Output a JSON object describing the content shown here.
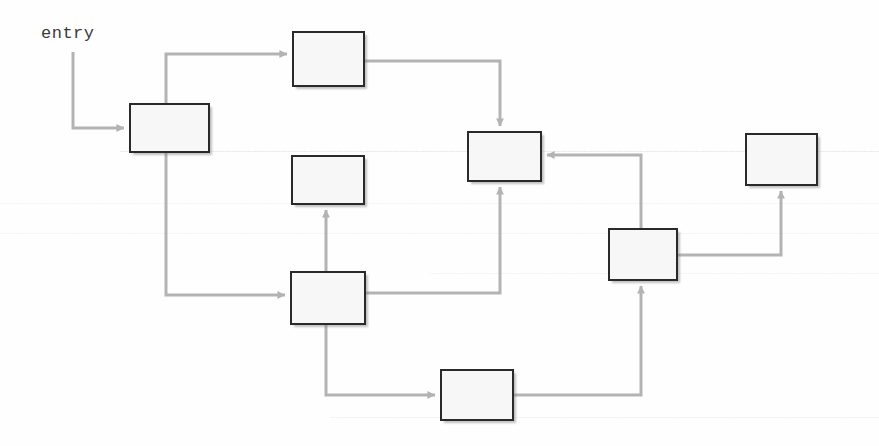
{
  "diagram": {
    "type": "control-flow-graph",
    "title": "",
    "entry_label": "entry",
    "canvas": {
      "width": 879,
      "height": 446
    },
    "style": {
      "background_color": "#fefefe",
      "node_fill": "#f7f7f7",
      "node_border_color": "#2a2a2a",
      "edge_color": "#b3b3b3",
      "label_color": "#3a3a3a"
    },
    "nodes": [
      {
        "id": "n1",
        "label": "",
        "x": 129,
        "y": 103,
        "w": 81,
        "h": 50
      },
      {
        "id": "n2",
        "label": "",
        "x": 292,
        "y": 31,
        "w": 73,
        "h": 56
      },
      {
        "id": "n3",
        "label": "",
        "x": 291,
        "y": 155,
        "w": 74,
        "h": 50
      },
      {
        "id": "n4",
        "label": "",
        "x": 467,
        "y": 131,
        "w": 75,
        "h": 51
      },
      {
        "id": "n5",
        "label": "",
        "x": 290,
        "y": 271,
        "w": 76,
        "h": 54
      },
      {
        "id": "n6",
        "label": "",
        "x": 608,
        "y": 228,
        "w": 70,
        "h": 53
      },
      {
        "id": "n7",
        "label": "",
        "x": 745,
        "y": 133,
        "w": 73,
        "h": 53
      },
      {
        "id": "n8",
        "label": "",
        "x": 440,
        "y": 369,
        "w": 74,
        "h": 52
      }
    ],
    "edges": [
      {
        "id": "e0",
        "from": "entry",
        "to": "n1",
        "points": "73,52 73,128 124,128",
        "arrow": "right"
      },
      {
        "id": "e1",
        "from": "n1",
        "to": "n2",
        "points": "166,103 166,54 287,54",
        "arrow": "right"
      },
      {
        "id": "e2",
        "from": "n2",
        "to": "n4",
        "points": "365,61 500,61 500,126",
        "arrow": "down"
      },
      {
        "id": "e3",
        "from": "n1",
        "to": "n5",
        "points": "166,153 166,295 285,295",
        "arrow": "right"
      },
      {
        "id": "e4",
        "from": "n5",
        "to": "n3",
        "points": "326,271 326,210",
        "arrow": "up"
      },
      {
        "id": "e5",
        "from": "n5",
        "to": "n4",
        "points": "366,293 500,293 500,187",
        "arrow": "up"
      },
      {
        "id": "e6",
        "from": "n5",
        "to": "n8",
        "points": "326,325 326,395 435,395",
        "arrow": "right"
      },
      {
        "id": "e7",
        "from": "n8",
        "to": "n6",
        "points": "514,395 641,395 641,286",
        "arrow": "up"
      },
      {
        "id": "e8",
        "from": "n6",
        "to": "n4",
        "points": "641,228 641,155 547,155",
        "arrow": "left"
      },
      {
        "id": "e9",
        "from": "n6",
        "to": "n7",
        "points": "678,255 781,255 781,191",
        "arrow": "up"
      }
    ]
  }
}
